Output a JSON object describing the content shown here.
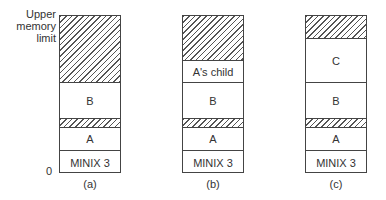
{
  "axis": {
    "upper_label_lines": [
      "Upper",
      "memory",
      "limit"
    ],
    "zero_label": "0"
  },
  "diagrams": [
    {
      "caption": "(a)",
      "segments": [
        {
          "label": "",
          "type": "free",
          "top": 0,
          "height": 67
        },
        {
          "label": "B",
          "type": "process",
          "top": 67,
          "height": 36
        },
        {
          "label": "",
          "type": "free",
          "top": 103,
          "height": 9
        },
        {
          "label": "A",
          "type": "process",
          "top": 112,
          "height": 23
        },
        {
          "label": "MINIX 3",
          "type": "os",
          "top": 135,
          "height": 23
        }
      ]
    },
    {
      "caption": "(b)",
      "segments": [
        {
          "label": "",
          "type": "free",
          "top": 0,
          "height": 45
        },
        {
          "label": "A's child",
          "type": "process",
          "top": 45,
          "height": 22
        },
        {
          "label": "B",
          "type": "process",
          "top": 67,
          "height": 36
        },
        {
          "label": "",
          "type": "free",
          "top": 103,
          "height": 9
        },
        {
          "label": "A",
          "type": "process",
          "top": 112,
          "height": 23
        },
        {
          "label": "MINIX 3",
          "type": "os",
          "top": 135,
          "height": 23
        }
      ]
    },
    {
      "caption": "(c)",
      "segments": [
        {
          "label": "",
          "type": "free",
          "top": 0,
          "height": 23
        },
        {
          "label": "C",
          "type": "process",
          "top": 23,
          "height": 44
        },
        {
          "label": "B",
          "type": "process",
          "top": 67,
          "height": 36
        },
        {
          "label": "",
          "type": "free",
          "top": 103,
          "height": 9
        },
        {
          "label": "A",
          "type": "process",
          "top": 112,
          "height": 23
        },
        {
          "label": "MINIX 3",
          "type": "os",
          "top": 135,
          "height": 23
        }
      ]
    }
  ]
}
